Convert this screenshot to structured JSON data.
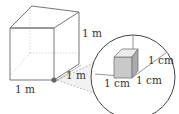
{
  "diagram": {
    "type": "cube-magnification",
    "large_cube": {
      "edge_labels": {
        "bottom": "1 m",
        "right_vertical": "1 m",
        "depth": "1 m"
      }
    },
    "magnified_view": {
      "edge_labels": {
        "right": "1 cm",
        "bottom_left": "1 cm",
        "bottom_right": "1 cm"
      }
    }
  },
  "colors": {
    "line": "#777777",
    "hidden_line": "#b5b5b5",
    "small_cube_front": "#c9c9c9",
    "small_cube_top": "#e8e8e8",
    "small_cube_side": "#a9a9a9",
    "highlight_dot": "#555555"
  }
}
